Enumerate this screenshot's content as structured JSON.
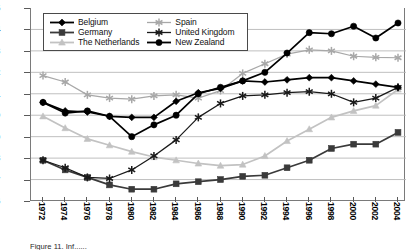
{
  "chart_data": {
    "type": "line",
    "title": "",
    "xlabel": "",
    "ylabel": "",
    "categories": [
      "1972",
      "1974",
      "1976",
      "1978",
      "1980",
      "1982",
      "1984",
      "1986",
      "1988",
      "1990",
      "1992",
      "1994",
      "1996",
      "1998",
      "2000",
      "2002",
      "2004"
    ],
    "ylim": [
      0.06,
      0.15
    ],
    "ytick_labels": [
      "0,15",
      "0,14",
      "0,13",
      "0,12",
      "0,11",
      "0,10",
      "0,09",
      "0,08",
      "0,07",
      "0,06"
    ],
    "ytick_values": [
      0.15,
      0.14,
      0.13,
      0.12,
      0.11,
      0.1,
      0.09,
      0.08,
      0.07,
      0.06
    ],
    "grid": true,
    "legend_position": "top-left-inside",
    "decimal_separator": ",",
    "series": [
      {
        "name": "Belgium",
        "color": "#000000",
        "marker": "diamond",
        "values": [
          0.106,
          0.102,
          0.1015,
          0.0995,
          0.099,
          0.099,
          0.1065,
          0.1105,
          0.1125,
          0.116,
          0.1155,
          0.1165,
          0.1175,
          0.1175,
          0.116,
          0.1145,
          0.113
        ]
      },
      {
        "name": "Germany",
        "color": "#3a3a3a",
        "marker": "square",
        "values": [
          0.079,
          0.0745,
          0.071,
          0.0675,
          0.0655,
          0.0655,
          0.068,
          0.069,
          0.07,
          0.0715,
          0.072,
          0.0755,
          0.079,
          0.0845,
          0.0865,
          0.0865,
          0.092
        ]
      },
      {
        "name": "The Netherlands",
        "color": "#c2c2c2",
        "marker": "triangle",
        "values": [
          0.0995,
          0.094,
          0.089,
          0.086,
          0.083,
          0.0805,
          0.079,
          0.0775,
          0.0765,
          0.077,
          0.081,
          0.088,
          0.0935,
          0.099,
          0.102,
          0.1045,
          0.112
        ]
      },
      {
        "name": "Spain",
        "color": "#a8a8a8",
        "marker": "star",
        "values": [
          0.1185,
          0.1155,
          0.1095,
          0.108,
          0.1075,
          0.109,
          0.1095,
          0.108,
          0.1115,
          0.1195,
          0.124,
          0.1285,
          0.1305,
          0.13,
          0.1275,
          0.127,
          0.1268
        ]
      },
      {
        "name": "United Kingdom",
        "color": "#1a1a1a",
        "marker": "star",
        "values": [
          0.079,
          0.0755,
          0.071,
          0.0705,
          0.0745,
          0.081,
          0.0885,
          0.099,
          0.1055,
          0.109,
          0.1095,
          0.1105,
          0.111,
          0.11,
          0.106,
          0.108,
          0.113
        ]
      },
      {
        "name": "New Zealand",
        "color": "#000000",
        "marker": "circle",
        "values": [
          0.106,
          0.101,
          0.102,
          0.0995,
          0.09,
          0.0955,
          0.1,
          0.11,
          0.113,
          0.116,
          0.12,
          0.129,
          0.1385,
          0.138,
          0.1415,
          0.136,
          0.143
        ]
      }
    ]
  },
  "legend": {
    "entries": [
      {
        "label": "Belgium"
      },
      {
        "label": "Spain"
      },
      {
        "label": "Germany"
      },
      {
        "label": "United Kingdom"
      },
      {
        "label": "The Netherlands"
      },
      {
        "label": "New Zealand"
      }
    ]
  },
  "caption": {
    "text": "Figure 11. Inf......"
  }
}
